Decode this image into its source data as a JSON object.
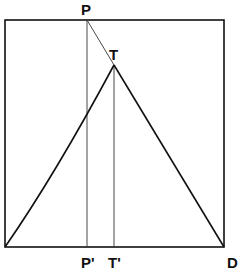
{
  "diagram": {
    "type": "geometric-construction",
    "labels": {
      "P": "P",
      "T": "T",
      "P_prime": "P'",
      "T_prime": "T'",
      "D": "D"
    },
    "colors": {
      "stroke": "#111111",
      "background": "#ffffff"
    },
    "points": {
      "P": [
        87,
        20
      ],
      "T": [
        114,
        65
      ],
      "P_prime": [
        87,
        247
      ],
      "T_prime": [
        114,
        247
      ],
      "D": [
        224,
        247
      ],
      "bottom_left": [
        5,
        247
      ]
    },
    "frame": {
      "x": 5,
      "y": 20,
      "width": 219,
      "height": 227
    }
  }
}
